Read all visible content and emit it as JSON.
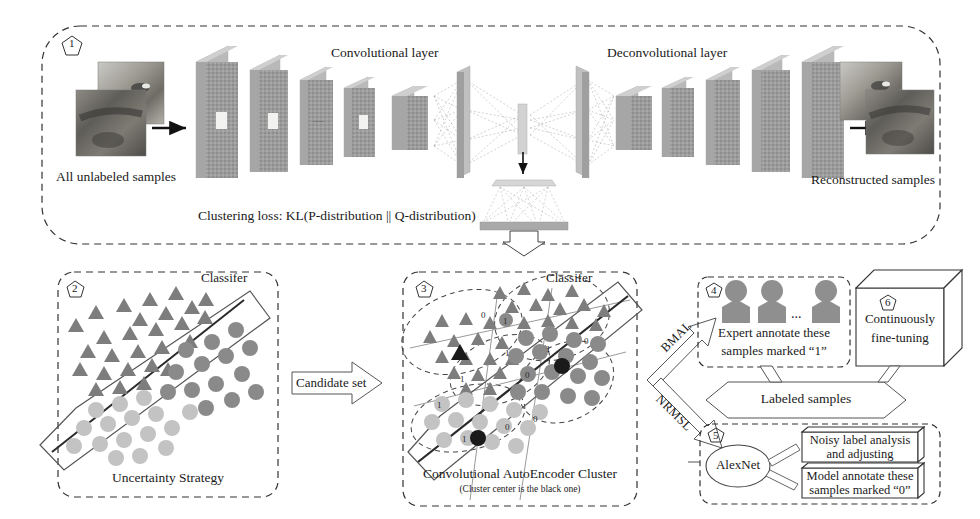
{
  "figure": {
    "type": "pipeline-diagram",
    "background": "#ffffff",
    "ink": "#1a1a1a"
  },
  "panel1": {
    "marker": "1",
    "input_label": "All unlabeled samples",
    "conv_label": "Convolutional layer",
    "deconv_label": "Deconvolutional layer",
    "loss_label": "Clustering loss: KL(P-distribution || Q-distribution)",
    "output_label": "Reconstructed samples",
    "conv_slab_count": 5,
    "deconv_slab_count": 5,
    "slab_color": "#9a9a9a",
    "slab_edge_color": "#c4c4c4"
  },
  "panel2": {
    "marker": "2",
    "classifier_label": "Classifer",
    "caption": "Uncertainty Strategy",
    "triangle_color": "#7d7d7d",
    "circle_dark_color": "#8a8a8a",
    "circle_light_color": "#c3c3c3"
  },
  "panel3": {
    "marker": "3",
    "classifier_label": "Classifer",
    "caption": "Convolutional AutoEncoder Cluster",
    "sub_caption": "(Cluster center is the black one)",
    "center_color": "#1a1a1a",
    "point_labels": [
      "1",
      "1",
      "0",
      "1",
      "0",
      "0",
      "1",
      "0",
      "0",
      "1",
      "0"
    ]
  },
  "panel4": {
    "marker": "4",
    "line1": "Expert annotate these",
    "line2": "samples marked  “1”",
    "person_count": 3,
    "ellipsis": "...",
    "person_color": "#8f8f8f"
  },
  "panel5": {
    "marker": "5",
    "model_label": "AlexNet",
    "box1_line1": "Noisy label analysis",
    "box1_line2": "and adjusting",
    "box2_line1": "Model annotate these",
    "box2_line2": "samples marked “0”"
  },
  "panel6": {
    "marker": "6",
    "line1": "Continuously",
    "line2": "fine-tuning"
  },
  "arrows": {
    "candidate_set": "Candidate set",
    "bmal": "BMAL",
    "nrmsl": "NRMSL",
    "labeled_samples": "Labeled samples"
  }
}
